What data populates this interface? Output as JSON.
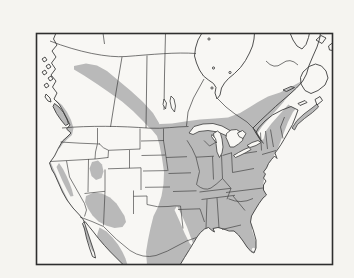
{
  "map": {
    "kind": "species-range-map",
    "area": "north-america",
    "shaded_region_names": [
      "eastern-north-america",
      "boreal-diagonal-band",
      "pacific-northwest-coast",
      "california-coast-strip",
      "sierra-nevada-strip",
      "utah-highlands-patch",
      "arizona-new-mexico-highlands",
      "sierra-madre-occidental",
      "northeast-mexico-central-texas",
      "baja-california-strip",
      "nova-scotia-maritimes"
    ]
  },
  "colors": {
    "paper": "#f5f4f0",
    "land": "#f8f7f4",
    "shade": "#b9b9b9",
    "line": "#3d3d3d",
    "frame": "#2e2e2e"
  }
}
